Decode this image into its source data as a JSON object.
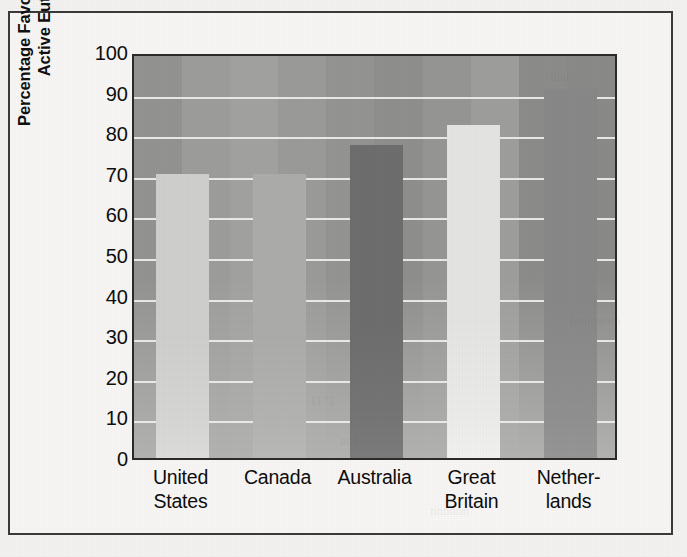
{
  "figure": {
    "background_color": "#f3f2f0",
    "frame_color": "#3a3a3a"
  },
  "chart_data": {
    "type": "bar",
    "title": "",
    "xlabel": "",
    "ylabel": "Percentage Favoring Voluntary Active Euthanasia",
    "ylabel_lines": [
      "Percentage Favoring Voluntary",
      "Active Euthanasia"
    ],
    "categories": [
      "United States",
      "Canada",
      "Australia",
      "Great Britain",
      "Netherlands"
    ],
    "category_lines": [
      [
        "United",
        "States"
      ],
      [
        "Canada",
        ""
      ],
      [
        "Australia",
        ""
      ],
      [
        "Great",
        "Britain"
      ],
      [
        "Nether-",
        "lands"
      ]
    ],
    "values": [
      70,
      70,
      77,
      82,
      91
    ],
    "ylim": [
      0,
      100
    ],
    "ytick_step": 10,
    "yticks": [
      100,
      90,
      80,
      70,
      60,
      50,
      40,
      30,
      20,
      10,
      0
    ],
    "ytick_labels": [
      "100",
      "90",
      "80",
      "70",
      "60",
      "50",
      "40",
      "30",
      "20",
      "10",
      "0"
    ],
    "grid": true,
    "gridline_color": "#f0f0ee",
    "legend": false,
    "bar_colors": [
      "#cfcfcd",
      "#acacaa",
      "#6e6e6e",
      "#e4e4e2",
      "#888888"
    ],
    "plot_background_color": "#9a9a9a"
  },
  "bleed_text": {
    "a": "that",
    "b": "mmmmm",
    "c": "1171",
    "d": "and",
    "e": "nnnnnn"
  }
}
